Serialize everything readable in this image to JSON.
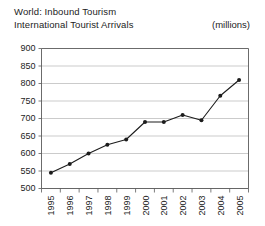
{
  "header": {
    "title_line1": "World: Inbound Tourism",
    "title_line2": "International Tourist Arrivals",
    "units": "(millions)"
  },
  "chart_data": {
    "type": "line",
    "title": "World: Inbound Tourism International Tourist Arrivals",
    "subtitle": "International Tourist Arrivals",
    "units": "(millions)",
    "xlabel": "",
    "ylabel": "",
    "categories": [
      "1995",
      "1996",
      "1997",
      "1998",
      "1999",
      "2000",
      "2001",
      "2002",
      "2003",
      "2004",
      "2005"
    ],
    "values": [
      545,
      570,
      600,
      625,
      640,
      690,
      690,
      710,
      695,
      765,
      810
    ],
    "series": [
      {
        "name": "International Tourist Arrivals",
        "values": [
          545,
          570,
          600,
          625,
          640,
          690,
          690,
          710,
          695,
          765,
          810
        ]
      }
    ],
    "ylim": [
      500,
      900
    ],
    "ytick_step": 50,
    "yticks": [
      500,
      550,
      600,
      650,
      700,
      750,
      800,
      850,
      900
    ],
    "ytick_labels": [
      "500",
      "550",
      "600",
      "650",
      "700",
      "750",
      "800",
      "850",
      "900"
    ],
    "xtick_labels": [
      "1995",
      "1996",
      "1997",
      "1998",
      "1999",
      "2000",
      "2001",
      "2002",
      "2003",
      "2004",
      "2005"
    ],
    "grid": true,
    "grid_axis": "y",
    "legend": false,
    "legend_position": "none",
    "marker": "filled-circle",
    "line_color": "#1c1c1c",
    "grid_color": "#b4b4b4",
    "axis_color": "#5a5a5a",
    "background": "#ffffff"
  }
}
